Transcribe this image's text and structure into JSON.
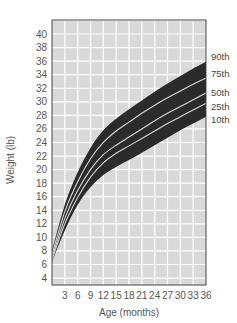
{
  "chart_data": {
    "type": "area",
    "title": "",
    "xlabel": "Age (months)",
    "ylabel": "Weight (lb)",
    "xlim": [
      0,
      36
    ],
    "ylim": [
      3,
      42
    ],
    "grid": true,
    "x_ticks": [
      3,
      6,
      9,
      12,
      15,
      18,
      21,
      24,
      27,
      30,
      33,
      36
    ],
    "y_ticks": [
      4,
      6,
      8,
      10,
      12,
      14,
      16,
      18,
      20,
      22,
      24,
      26,
      28,
      30,
      32,
      34,
      36,
      38,
      40
    ],
    "legend_position": "right-end labels",
    "x": [
      0,
      3,
      6,
      9,
      12,
      15,
      18,
      21,
      24,
      27,
      30,
      33,
      36
    ],
    "series": [
      {
        "name": "90th",
        "values": [
          8.0,
          14.8,
          19.6,
          23.2,
          25.8,
          27.5,
          28.9,
          30.2,
          31.5,
          32.7,
          33.8,
          34.9,
          35.9
        ]
      },
      {
        "name": "75th",
        "values": [
          7.5,
          13.8,
          18.2,
          21.6,
          24.0,
          25.7,
          27.0,
          28.3,
          29.5,
          30.6,
          31.6,
          32.6,
          33.5
        ]
      },
      {
        "name": "50th",
        "values": [
          7.0,
          12.8,
          16.9,
          20.0,
          22.2,
          23.6,
          24.8,
          26.0,
          27.2,
          28.3,
          29.3,
          30.3,
          31.3
        ]
      },
      {
        "name": "25th",
        "values": [
          6.7,
          12.0,
          15.9,
          18.9,
          21.0,
          22.4,
          23.5,
          24.6,
          25.7,
          26.8,
          27.8,
          28.8,
          29.8
        ]
      },
      {
        "name": "10th",
        "values": [
          6.4,
          11.0,
          14.8,
          17.4,
          19.2,
          20.4,
          21.4,
          22.5,
          23.6,
          24.7,
          25.8,
          26.8,
          27.8
        ]
      }
    ],
    "band_fill": "#2b2b2b",
    "line_color": "#d8d8d8",
    "plot_bg": "#d9d9d9",
    "grid_color": "#ffffff"
  },
  "labels": {
    "xlabel": "Age (months)",
    "ylabel": "Weight (lb)"
  }
}
